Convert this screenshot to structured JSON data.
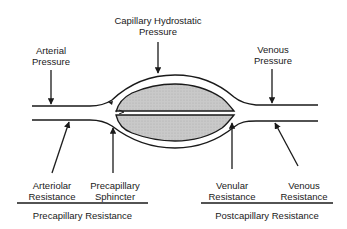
{
  "diagram": {
    "type": "capillary pressure and resistance schematic",
    "top_labels": {
      "arterial_pressure": [
        "Arterial",
        "Pressure"
      ],
      "capillary_hydrostatic_pressure": [
        "Capillary Hydrostatic",
        "Pressure"
      ],
      "venous_pressure": [
        "Venous",
        "Pressure"
      ]
    },
    "bottom_labels": {
      "arteriolar_resistance": [
        "Arteriolar",
        "Resistance"
      ],
      "precapillary_sphincter": [
        "Precapillary",
        "Sphincter"
      ],
      "venular_resistance": [
        "Venular",
        "Resistance"
      ],
      "venous_resistance": [
        "Venous",
        "Resistance"
      ]
    },
    "group_labels": {
      "precapillary": "Precapillary Resistance",
      "postcapillary": "Postcapillary Resistance"
    },
    "colors": {
      "line": "#1a1a1a",
      "cell_fill": "#c8c8c8",
      "background": "#ffffff"
    }
  }
}
